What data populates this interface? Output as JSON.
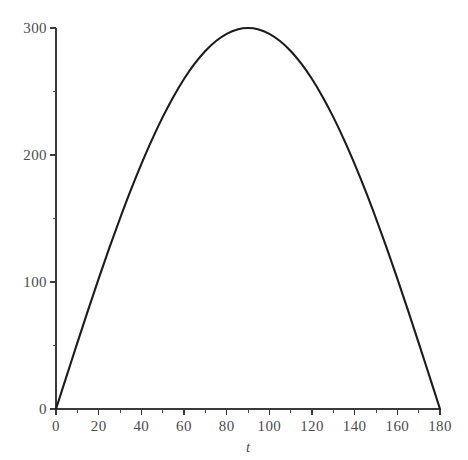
{
  "chart_data": {
    "type": "line",
    "title": "",
    "subtitle": "",
    "xlabel": "t",
    "ylabel": "",
    "xlim": [
      0,
      180
    ],
    "ylim": [
      0,
      300
    ],
    "grid": false,
    "legend": false,
    "legend_position": "none",
    "series": [
      {
        "name": "300 sin(t)",
        "color": "#1c1c1c",
        "x": [
          0,
          5,
          10,
          15,
          20,
          25,
          30,
          35,
          40,
          45,
          50,
          55,
          60,
          65,
          70,
          75,
          80,
          85,
          90,
          95,
          100,
          105,
          110,
          115,
          120,
          125,
          130,
          135,
          140,
          145,
          150,
          155,
          160,
          165,
          170,
          175,
          180
        ],
        "values": [
          0,
          26.1,
          52.1,
          77.6,
          102.6,
          126.8,
          150,
          172.1,
          192.8,
          212.1,
          229.8,
          245.7,
          259.8,
          271.9,
          281.9,
          289.8,
          295.4,
          298.9,
          300,
          298.9,
          295.4,
          289.8,
          281.9,
          271.9,
          259.8,
          245.7,
          229.8,
          212.1,
          192.8,
          172.1,
          150,
          126.8,
          102.6,
          77.6,
          52.1,
          26.1,
          0
        ]
      }
    ],
    "x_axis": {
      "major_ticks": [
        0,
        20,
        40,
        60,
        80,
        100,
        120,
        140,
        160,
        180
      ],
      "major_tick_labels": [
        "0",
        "20",
        "40",
        "60",
        "80",
        "100",
        "120",
        "140",
        "160",
        "180"
      ],
      "minor_ticks": [
        10,
        30,
        50,
        70,
        90,
        110,
        130,
        150,
        170
      ]
    },
    "y_axis": {
      "major_ticks": [
        0,
        100,
        200,
        300
      ],
      "major_tick_labels": [
        "0",
        "100",
        "200",
        "300"
      ],
      "minor_ticks": [
        50,
        150,
        250
      ]
    },
    "colors": {
      "background": "#ffffff",
      "curve": "#1c1c1c",
      "axis": "#3a3a3a",
      "tick_label": "#4c4c4c"
    }
  }
}
